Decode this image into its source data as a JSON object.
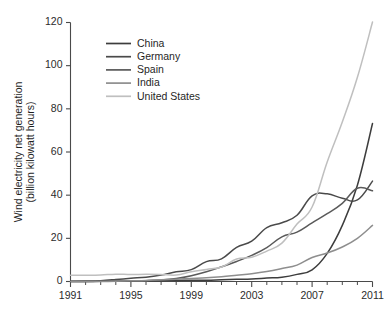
{
  "chart_data": {
    "type": "line",
    "title": "",
    "xlabel": "",
    "ylabel": "Wind electricity net generation\n(billion kilowatt hours)",
    "ylabel_line1": "Wind electricity net generation",
    "ylabel_line2": "(billion kilowatt hours)",
    "xlim": [
      1991,
      2011
    ],
    "ylim": [
      0,
      120
    ],
    "grid": false,
    "legend_position": "upper-left-inside",
    "y_ticks": [
      0,
      20,
      40,
      60,
      80,
      100,
      120
    ],
    "y_tick_labels": [
      "0",
      "20",
      "40",
      "60",
      "80",
      "100",
      "120"
    ],
    "x_ticks": [
      1991,
      1995,
      1999,
      2003,
      2007,
      2011
    ],
    "x_tick_labels": [
      "1991",
      "1995",
      "1999",
      "2003",
      "2007",
      "2011"
    ],
    "x_minor_ticks": [
      1992,
      1993,
      1994,
      1996,
      1997,
      1998,
      2000,
      2001,
      2002,
      2004,
      2005,
      2006,
      2008,
      2009,
      2010
    ],
    "x": [
      1991,
      1992,
      1993,
      1994,
      1995,
      1996,
      1997,
      1998,
      1999,
      2000,
      2001,
      2002,
      2003,
      2004,
      2005,
      2006,
      2007,
      2008,
      2009,
      2010,
      2011
    ],
    "series": [
      {
        "name": "China",
        "color": "#3d3d3d",
        "values": [
          0.0,
          0.0,
          0.1,
          0.1,
          0.2,
          0.3,
          0.4,
          0.5,
          0.6,
          0.6,
          0.8,
          1.0,
          1.2,
          1.6,
          2.0,
          3.3,
          5.4,
          13.0,
          26.0,
          44.6,
          73.2
        ]
      },
      {
        "name": "Germany",
        "color": "#4a4a4a",
        "values": [
          0.1,
          0.2,
          0.4,
          0.9,
          1.5,
          2.0,
          3.0,
          4.5,
          5.5,
          9.2,
          10.5,
          15.8,
          18.7,
          25.0,
          27.2,
          30.7,
          39.7,
          40.6,
          38.6,
          37.8,
          46.5
        ]
      },
      {
        "name": "Spain",
        "color": "#5a5a5a",
        "values": [
          0.0,
          0.0,
          0.1,
          0.2,
          0.3,
          0.4,
          0.7,
          1.4,
          2.7,
          4.5,
          6.8,
          9.3,
          12.1,
          15.7,
          20.7,
          22.9,
          27.2,
          31.4,
          36.2,
          43.2,
          42.0
        ]
      },
      {
        "name": "India",
        "color": "#8e8e8e",
        "values": [
          0.0,
          0.0,
          0.0,
          0.1,
          0.3,
          0.5,
          0.8,
          1.1,
          1.4,
          1.7,
          2.2,
          2.9,
          3.6,
          4.6,
          6.0,
          7.6,
          11.1,
          13.2,
          16.0,
          20.0,
          26.0
        ]
      },
      {
        "name": "United States",
        "color": "#bfbfbf",
        "values": [
          2.9,
          2.9,
          3.0,
          3.4,
          3.2,
          3.4,
          3.3,
          3.0,
          4.5,
          5.6,
          6.7,
          10.4,
          11.2,
          14.1,
          17.8,
          26.6,
          34.5,
          55.4,
          73.9,
          94.6,
          120.2
        ]
      }
    ]
  },
  "legend": {
    "items": [
      {
        "label": "China"
      },
      {
        "label": "Germany"
      },
      {
        "label": "Spain"
      },
      {
        "label": "India"
      },
      {
        "label": "United States"
      }
    ]
  }
}
